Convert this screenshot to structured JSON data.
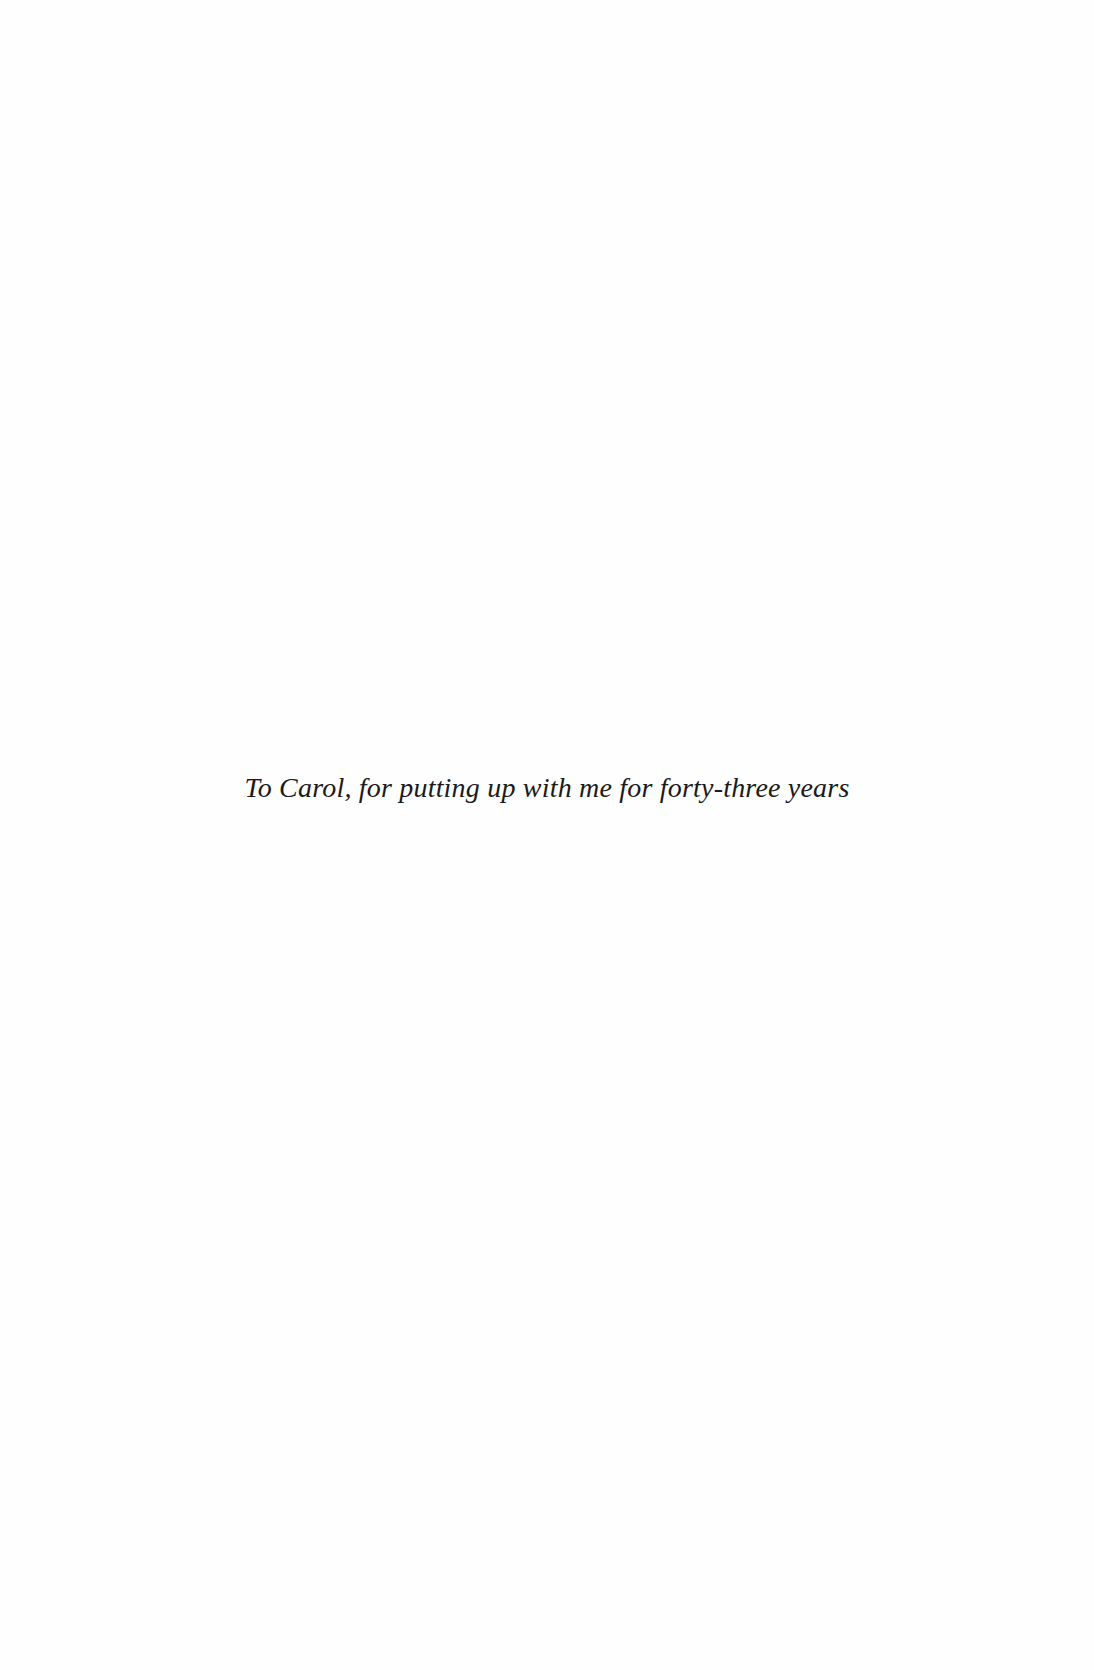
{
  "page": {
    "dedication": "To Carol, for putting up with me for forty-three years"
  }
}
